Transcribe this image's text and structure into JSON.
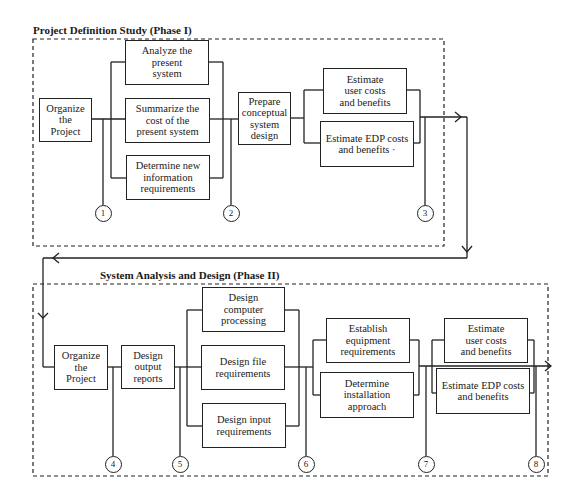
{
  "phase1": {
    "title": "Project Definition Study (Phase I)",
    "nodes": [
      {
        "id": "organize",
        "label": "Organize\nthe\nProject"
      },
      {
        "id": "analyze",
        "label": "Analyze the\npresent\nsystem"
      },
      {
        "id": "summarize",
        "label": "Summarize the\ncost of the\npresent system"
      },
      {
        "id": "determine-info",
        "label": "Determine new\ninformation\nrequirements"
      },
      {
        "id": "prepare",
        "label": "Prepare\nconceptual\nsystem\ndesign"
      },
      {
        "id": "estimate-user",
        "label": "Estimate\nuser costs\nand benefits"
      },
      {
        "id": "estimate-edp",
        "label": "Estimate EDP costs\nand benefits ·"
      }
    ],
    "milestones": [
      "1",
      "2",
      "3"
    ]
  },
  "phase2": {
    "title": "System Analysis and Design (Phase II)",
    "nodes": [
      {
        "id": "organize",
        "label": "Organize\nthe\nProject"
      },
      {
        "id": "design-output",
        "label": "Design\noutput\nreports"
      },
      {
        "id": "design-computer",
        "label": "Design\ncomputer\nprocessing"
      },
      {
        "id": "design-file",
        "label": "Design file\nrequirements"
      },
      {
        "id": "design-input",
        "label": "Design input\nrequirements"
      },
      {
        "id": "establish-equipment",
        "label": "Establish\nequipment\nrequirements"
      },
      {
        "id": "determine-installation",
        "label": "Determine\ninstallation\napproach"
      },
      {
        "id": "estimate-user",
        "label": "Estimate\nuser costs\nand benefits"
      },
      {
        "id": "estimate-edp",
        "label": "Estimate EDP costs\nand benefits"
      }
    ],
    "milestones": [
      "4",
      "5",
      "6",
      "7",
      "8"
    ]
  },
  "colors": {
    "line": "#222222",
    "background": "#ffffff"
  }
}
